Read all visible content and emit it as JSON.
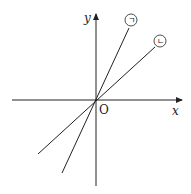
{
  "diagram": {
    "axes": {
      "x_label": "x",
      "y_label": "y",
      "origin_label": "O"
    },
    "lines": [
      {
        "label": "ㄱ",
        "description": "steeper line through origin"
      },
      {
        "label": "ㄴ",
        "description": "less steep line through origin"
      }
    ],
    "colors": {
      "stroke": "#222222",
      "background": "#ffffff"
    }
  }
}
